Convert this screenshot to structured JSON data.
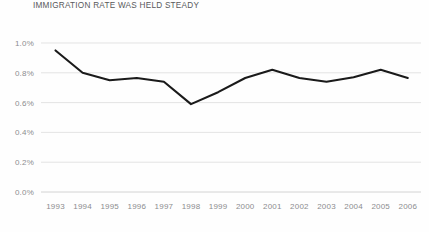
{
  "chart_data": {
    "type": "line",
    "title": "IMMIGRATION RATE WAS HELD STEADY",
    "xlabel": "",
    "ylabel": "",
    "categories": [
      "1993",
      "1994",
      "1995",
      "1996",
      "1997",
      "1998",
      "1999",
      "2000",
      "2001",
      "2002",
      "2003",
      "2004",
      "2005",
      "2006"
    ],
    "values": [
      0.95,
      0.8,
      0.75,
      0.765,
      0.74,
      0.59,
      0.67,
      0.765,
      0.82,
      0.765,
      0.74,
      0.77,
      0.82,
      0.765
    ],
    "series": [
      {
        "name": "Immigration rate",
        "values": [
          0.95,
          0.8,
          0.75,
          0.765,
          0.74,
          0.59,
          0.67,
          0.765,
          0.82,
          0.765,
          0.74,
          0.77,
          0.82,
          0.765
        ]
      }
    ],
    "ylim": [
      0.0,
      1.0
    ],
    "ytick_labels": [
      "1.0%",
      "0.8%",
      "0.6%",
      "0.4%",
      "0.2%",
      "0.0%"
    ],
    "ytick_values": [
      1.0,
      0.8,
      0.6,
      0.4,
      0.2,
      0.0
    ],
    "xtick_labels": [
      "1993",
      "1994",
      "1995",
      "1996",
      "1997",
      "1998",
      "1999",
      "2000",
      "2001",
      "2002",
      "2003",
      "2004",
      "2005",
      "2006"
    ],
    "grid": true,
    "legend": "none",
    "line_color": "#1a1a1a",
    "grid_color": "#d9d9d9",
    "tick_text_color": "#8c8d8f",
    "title_color": "#58595b",
    "background_color": "#ffffff"
  }
}
